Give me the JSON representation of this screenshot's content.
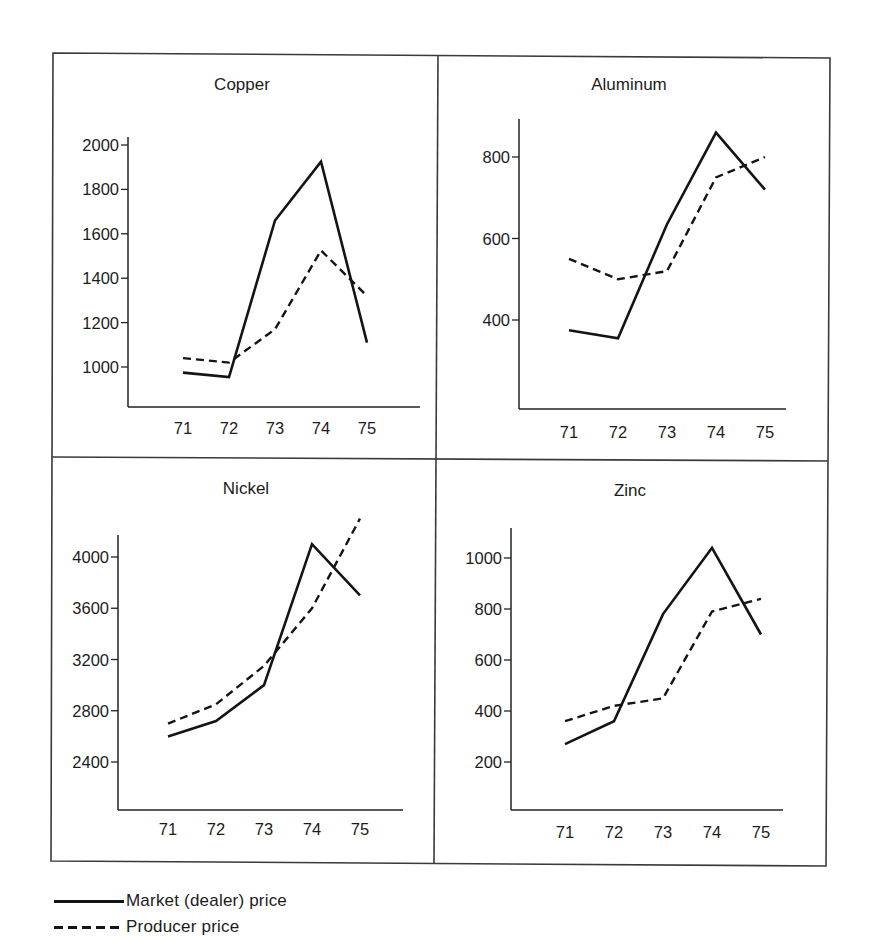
{
  "figure": {
    "legend": [
      {
        "key": "market",
        "label": "Market (dealer) price",
        "style": "solid"
      },
      {
        "key": "producer",
        "label": "Producer price",
        "style": "dashed"
      }
    ],
    "colors": {
      "line": "#141414",
      "frame": "#3a3a3a",
      "background": "#ffffff"
    }
  },
  "chart_data": [
    {
      "type": "line",
      "title": "Copper",
      "xlabel": "",
      "ylabel": "",
      "categories": [
        "71",
        "72",
        "73",
        "74",
        "75"
      ],
      "yticks": [
        1000,
        1200,
        1400,
        1600,
        1800,
        2000
      ],
      "ylim": [
        820,
        2050
      ],
      "grid": false,
      "legend_position": "bottom (shared)",
      "series": [
        {
          "name": "Market (dealer) price",
          "style": "solid",
          "values": [
            975,
            955,
            1660,
            1925,
            1110
          ]
        },
        {
          "name": "Producer price",
          "style": "dashed",
          "values": [
            1040,
            1020,
            1170,
            1525,
            1320
          ]
        }
      ]
    },
    {
      "type": "line",
      "title": "Aluminum",
      "xlabel": "",
      "ylabel": "",
      "categories": [
        "71",
        "72",
        "73",
        "74",
        "75"
      ],
      "yticks": [
        400,
        600,
        800
      ],
      "ylim": [
        180,
        890
      ],
      "grid": false,
      "legend_position": "bottom (shared)",
      "series": [
        {
          "name": "Market (dealer) price",
          "style": "solid",
          "values": [
            375,
            355,
            635,
            860,
            720
          ]
        },
        {
          "name": "Producer price",
          "style": "dashed",
          "values": [
            550,
            500,
            520,
            750,
            800
          ]
        }
      ]
    },
    {
      "type": "line",
      "title": "Nickel",
      "xlabel": "",
      "ylabel": "",
      "categories": [
        "71",
        "72",
        "73",
        "74",
        "75"
      ],
      "yticks": [
        2400,
        2800,
        3200,
        3600,
        4000
      ],
      "ylim": [
        2020,
        4350
      ],
      "grid": false,
      "legend_position": "bottom (shared)",
      "series": [
        {
          "name": "Market (dealer) price",
          "style": "solid",
          "values": [
            2600,
            2720,
            3000,
            4100,
            3700
          ]
        },
        {
          "name": "Producer price",
          "style": "dashed",
          "values": [
            2700,
            2850,
            3150,
            3600,
            4300
          ]
        }
      ]
    },
    {
      "type": "line",
      "title": "Zinc",
      "xlabel": "",
      "ylabel": "",
      "categories": [
        "71",
        "72",
        "73",
        "74",
        "75"
      ],
      "yticks": [
        200,
        400,
        600,
        800,
        1000
      ],
      "ylim": [
        10,
        1120
      ],
      "grid": false,
      "legend_position": "bottom (shared)",
      "series": [
        {
          "name": "Market (dealer) price",
          "style": "solid",
          "values": [
            270,
            360,
            780,
            1040,
            700
          ]
        },
        {
          "name": "Producer price",
          "style": "dashed",
          "values": [
            360,
            420,
            450,
            790,
            840
          ]
        }
      ]
    }
  ]
}
